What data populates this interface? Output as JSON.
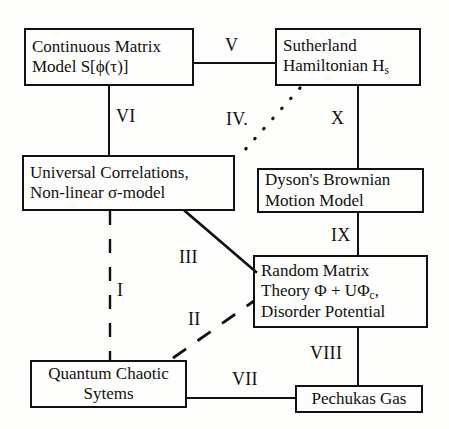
{
  "diagram": {
    "stroke_color": "#111111",
    "background_color": "#fdfdfb",
    "nodes": [
      {
        "id": "continuous-matrix-model",
        "line1": "Continuous Matrix",
        "line2": "Model S[ϕ(τ)]",
        "line3": ""
      },
      {
        "id": "sutherland-hamiltonian",
        "line1": "Sutherland",
        "line2": "Hamiltonian H",
        "line2_sub": "s",
        "line3": ""
      },
      {
        "id": "universal-correlations",
        "line1": "Universal Correlations,",
        "line2": "Non-linear σ-model",
        "line3": ""
      },
      {
        "id": "dysons-brownian-motion",
        "line1": "Dyson's Brownian",
        "line2": "Motion Model",
        "line3": ""
      },
      {
        "id": "random-matrix-theory",
        "line1": "Random Matrix",
        "line2": "Theory  Φ + UΦ",
        "line2_sub": "c",
        "line2_tail": ",",
        "line3": "Disorder Potential"
      },
      {
        "id": "quantum-chaotic-systems",
        "line1": "Quantum Chaotic",
        "line2": "Sytems",
        "line3": ""
      },
      {
        "id": "pechukas-gas",
        "line1": "Pechukas Gas",
        "line2": "",
        "line3": ""
      }
    ],
    "edge_labels": {
      "I": "I",
      "II": "II",
      "III": "III",
      "IV": "IV.",
      "V": "V",
      "VI": "VI",
      "VII": "VII",
      "VIII": "VIII",
      "IX": "IX",
      "X": "X"
    }
  }
}
